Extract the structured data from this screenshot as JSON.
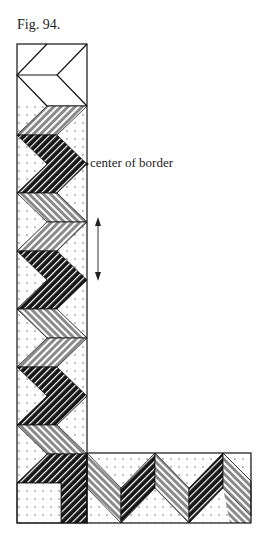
{
  "figure": {
    "caption": "Fig. 94.",
    "annotation_label": "center of border",
    "arrow": {
      "type": "double-headed",
      "orientation": "vertical",
      "meaning": "repeat length"
    },
    "colors": {
      "outline": "#111111",
      "dark_stripe": "#1a1a1a",
      "grey_stripe": "#8a8a8a",
      "stripe_light": "#ffffff",
      "dots": "#555555",
      "background": "#ffffff"
    },
    "vertical_strip": {
      "corner_top_block": "white chevron (outline only)",
      "bands": [
        "grey",
        "dark",
        "grey",
        "dark",
        "grey",
        "dark",
        "grey",
        "dark",
        "grey",
        "dark",
        "grey",
        "dark"
      ]
    },
    "horizontal_strip": {
      "bands": [
        "dark",
        "grey",
        "dark",
        "grey",
        "dark"
      ]
    },
    "corner_square": "dotted"
  }
}
